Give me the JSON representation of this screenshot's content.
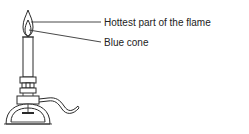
{
  "diagram": {
    "labels": [
      {
        "id": "hottest",
        "text": "Hottest part of the flame"
      },
      {
        "id": "blue-cone",
        "text": "Blue cone"
      }
    ],
    "colors": {
      "line": "#2a2a2a",
      "text": "#222222",
      "background": "#ffffff"
    }
  }
}
